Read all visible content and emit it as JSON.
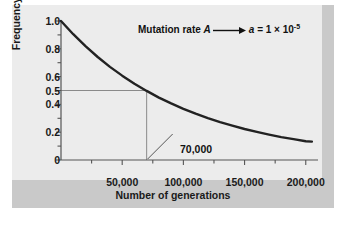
{
  "figure": {
    "panel_bg": "#c9c9c9",
    "plot_bg": "#ececec",
    "curve_color": "#222222",
    "axis_color": "#555555",
    "guide_color": "#8a8a8a"
  },
  "annotation": {
    "prefix": "Mutation rate ",
    "allele_from": "A",
    "arrow": "arrow-right-icon",
    "allele_to": "a",
    "equals": " = 1 ",
    "times": "×",
    "base": " 10",
    "exponent": "-5"
  },
  "callout": {
    "label": "70,000",
    "x_value": 70000,
    "y_value": 0.5
  },
  "chart_data": {
    "type": "line",
    "title": "",
    "xlabel": "Number of generations",
    "ylabel": "Frequency of A",
    "xlim": [
      0,
      210000
    ],
    "ylim": [
      0,
      1.0
    ],
    "grid": false,
    "legend": "none",
    "xticks": [
      0,
      50000,
      100000,
      150000,
      200000
    ],
    "xticklabels": [
      "",
      "50,000",
      "100,000",
      "150,000",
      "200,000"
    ],
    "xminorticks": [
      25000,
      75000,
      125000,
      175000
    ],
    "yticks": [
      0,
      0.2,
      0.4,
      0.5,
      0.6,
      0.8,
      1.0
    ],
    "yticklabels": [
      "0",
      "0.2",
      "0.4",
      "0.5",
      "0.6",
      "0.8",
      "1.0"
    ],
    "yminorticks": [
      0.1,
      0.3,
      0.7,
      0.9
    ],
    "mutation_rate": 1e-05,
    "series": [
      {
        "name": "Frequency of A",
        "x": [
          0,
          10000,
          20000,
          30000,
          40000,
          50000,
          60000,
          70000,
          80000,
          90000,
          100000,
          110000,
          120000,
          130000,
          140000,
          150000,
          160000,
          170000,
          180000,
          190000,
          200000,
          205000
        ],
        "values": [
          1.0,
          0.905,
          0.819,
          0.741,
          0.67,
          0.607,
          0.549,
          0.497,
          0.449,
          0.407,
          0.368,
          0.333,
          0.301,
          0.272,
          0.247,
          0.223,
          0.202,
          0.183,
          0.165,
          0.15,
          0.135,
          0.132
        ]
      }
    ],
    "guide_lines": [
      {
        "type": "horizontal",
        "y": 0.5,
        "from_x": 0,
        "to_x": 70000
      },
      {
        "type": "vertical",
        "x": 70000,
        "from_y": 0,
        "to_y": 0.5
      }
    ]
  }
}
